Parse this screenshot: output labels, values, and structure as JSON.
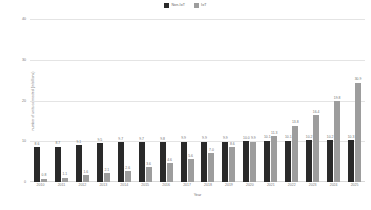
{
  "legend": {
    "position": "top-center",
    "entries": [
      {
        "label": "Non-IoT",
        "color": "#2a2a2a",
        "swatch": "square-icon"
      },
      {
        "label": "IoT",
        "color": "#9d9d9d",
        "swatch": "square-icon"
      }
    ]
  },
  "chart_data": {
    "type": "bar",
    "title": "",
    "subtitle": "",
    "xlabel": "Year",
    "ylabel": "number of units connected (in billions)",
    "ylim": [
      0,
      40
    ],
    "yticks": [
      0,
      10,
      20,
      30,
      40
    ],
    "grid": true,
    "categories": [
      "2010",
      "2011",
      "2012",
      "2013",
      "2014",
      "2015",
      "2016",
      "2017",
      "2018",
      "2019",
      "2020",
      "2021",
      "2022",
      "2023",
      "2024",
      "2025"
    ],
    "series": [
      {
        "name": "Non-IoT",
        "color": "#2a2a2a",
        "values": [
          8.6,
          8.7,
          9.1,
          9.5,
          9.7,
          9.7,
          9.8,
          9.9,
          9.9,
          9.9,
          10.0,
          10.1,
          10.1,
          10.2,
          10.2,
          10.3
        ],
        "labels": [
          "8.6",
          "8.7",
          "9.1",
          "9.5",
          "9.7",
          "9.7",
          "9.8",
          "9.9",
          "9.9",
          "9.9",
          "10.0",
          "10.1",
          "10.1",
          "10.2",
          "10.2",
          "10.3"
        ]
      },
      {
        "name": "IoT",
        "color": "#9d9d9d",
        "values": [
          0.8,
          1.1,
          1.6,
          2.1,
          2.6,
          3.6,
          4.6,
          5.6,
          7.0,
          8.6,
          9.9,
          11.3,
          13.8,
          16.4,
          19.8,
          24.4
        ],
        "labels": [
          "0.8",
          "1.1",
          "1.6",
          "2.1",
          "2.6",
          "3.6",
          "4.6",
          "5.6",
          "7.0",
          "8.6",
          "9.9",
          "11.3",
          "13.8",
          "16.4",
          "19.8",
          "30.9"
        ]
      }
    ]
  }
}
